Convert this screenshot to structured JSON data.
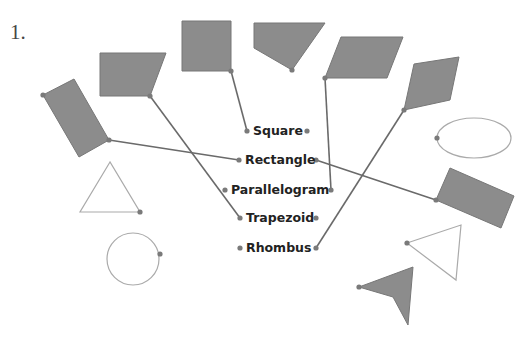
{
  "problem": {
    "number": "1."
  },
  "labels": [
    {
      "text": "Square",
      "x": 253,
      "y": 124
    },
    {
      "text": "Rectangle",
      "x": 245,
      "y": 153
    },
    {
      "text": "Parallelogram",
      "x": 231,
      "y": 183
    },
    {
      "text": "Trapezoid",
      "x": 246,
      "y": 211
    },
    {
      "text": "Rhombus",
      "x": 246,
      "y": 241
    }
  ],
  "colors": {
    "shape_fill": "#8c8c8c",
    "shape_stroke": "#777777",
    "connector": "#6a6a6a",
    "outline_shape": "#aaaaaa",
    "dot": "#7a7a7a"
  },
  "shapes": [
    {
      "id": "square",
      "type": "polygon",
      "filled": true,
      "points": "182,21 231,21 231,71 182,71"
    },
    {
      "id": "pentagon",
      "type": "polygon",
      "filled": true,
      "points": "254,23 325,23 292,70 254,48"
    },
    {
      "id": "parallelogram",
      "type": "polygon",
      "filled": true,
      "points": "341,37 403,37 387,78 325,78"
    },
    {
      "id": "rhombus",
      "type": "polygon",
      "filled": true,
      "points": "414,64 459,57 450,100 404,110"
    },
    {
      "id": "trapezoid",
      "type": "polygon",
      "filled": true,
      "points": "100,53 166,53 150,96 100,96"
    },
    {
      "id": "rectangle-left",
      "type": "polygon",
      "filled": true,
      "points": "43,95 74,79 109,140 79,157"
    },
    {
      "id": "rectangle-right",
      "type": "polygon",
      "filled": true,
      "points": "450,168 514,196 501,228 436,200"
    },
    {
      "id": "arrowhead",
      "type": "polygon",
      "filled": true,
      "points": "359,287 413,267 408,325 393,297"
    },
    {
      "id": "triangle-left",
      "type": "polygon",
      "filled": false,
      "points": "110,162 80,212 140,212"
    },
    {
      "id": "triangle-right",
      "type": "polygon",
      "filled": false,
      "points": "407,243 461,225 456,280"
    },
    {
      "id": "circle",
      "type": "circle",
      "filled": false,
      "cx": 133,
      "cy": 259,
      "r": 26
    },
    {
      "id": "ellipse",
      "type": "ellipse",
      "filled": false,
      "cx": 474,
      "cy": 138,
      "rx": 37,
      "ry": 20
    }
  ],
  "connections": [
    {
      "from_shape": "square",
      "to_label": "Square",
      "x1": 231,
      "y1": 71,
      "x2": 247,
      "y2": 131
    },
    {
      "from_shape": "trapezoid",
      "to_label": "Trapezoid",
      "x1": 150,
      "y1": 96,
      "x2": 240,
      "y2": 218
    },
    {
      "from_shape": "rectangle-left",
      "to_label": "Rectangle",
      "x1": 109,
      "y1": 140,
      "x2": 239,
      "y2": 160
    },
    {
      "from_shape": "parallelogram",
      "to_label": "Parallelogram",
      "x1": 325,
      "y1": 78,
      "x2": 331,
      "y2": 190
    },
    {
      "from_shape": "rhombus",
      "to_label": "Rhombus",
      "x1": 404,
      "y1": 110,
      "x2": 316,
      "y2": 248
    },
    {
      "from_shape": "rectangle-right",
      "to_label": "Rectangle",
      "x1": 436,
      "y1": 200,
      "x2": 316,
      "y2": 160
    }
  ],
  "dots": [
    [
      247,
      131
    ],
    [
      307,
      131
    ],
    [
      239,
      160
    ],
    [
      316,
      160
    ],
    [
      225,
      190
    ],
    [
      331,
      190
    ],
    [
      240,
      218
    ],
    [
      316,
      218
    ],
    [
      240,
      248
    ],
    [
      316,
      248
    ],
    [
      231,
      71
    ],
    [
      292,
      70
    ],
    [
      325,
      78
    ],
    [
      404,
      110
    ],
    [
      150,
      96
    ],
    [
      43,
      95
    ],
    [
      109,
      140
    ],
    [
      436,
      200
    ],
    [
      140,
      212
    ],
    [
      160,
      254
    ],
    [
      437,
      138
    ],
    [
      407,
      243
    ],
    [
      359,
      287
    ]
  ]
}
